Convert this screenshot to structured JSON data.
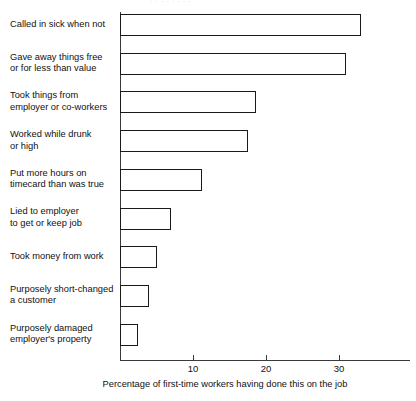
{
  "bleed_text": "· · · · · · · ·",
  "axis": {
    "x_title": "Percentage of first-time workers having done this on the job",
    "x_ticks": [
      {
        "value": 10,
        "label": "10"
      },
      {
        "value": 20,
        "label": "20"
      },
      {
        "value": 30,
        "label": "30"
      }
    ]
  },
  "chart_data": {
    "type": "bar",
    "orientation": "horizontal",
    "title": "",
    "subtitle": "",
    "xlabel": "Percentage of first-time workers having done this on the job",
    "ylabel": "",
    "xlim": [
      0,
      40
    ],
    "xticks": [
      10,
      20,
      30
    ],
    "grid": false,
    "legend": null,
    "bar_style": {
      "fill": "#ffffff",
      "edge": "#1a1a1a"
    },
    "categories": [
      "Called in sick when not",
      "Gave away things free or for less than value",
      "Took things from employer or co-workers",
      "Worked while drunk or high",
      "Put more hours on timecard than was true",
      "Lied to employer to get or keep job",
      "Took money from work",
      "Purposely short-changed a customer",
      "Purposely damaged employer's property"
    ],
    "values": [
      33,
      31,
      18.6,
      17.5,
      11.2,
      7,
      5,
      4,
      2.5
    ]
  },
  "categories_wrapped": [
    [
      "Called in sick when not"
    ],
    [
      "Gave away things free",
      "or for less than value"
    ],
    [
      "Took things from",
      "employer or co-workers"
    ],
    [
      "Worked while drunk",
      "or high"
    ],
    [
      "Put more hours on",
      "timecard than was true"
    ],
    [
      "Lied to employer",
      "to get or keep job"
    ],
    [
      "Took money from work"
    ],
    [
      "Purposely short-changed",
      "a customer"
    ],
    [
      "Purposely damaged",
      "employer's property"
    ]
  ]
}
